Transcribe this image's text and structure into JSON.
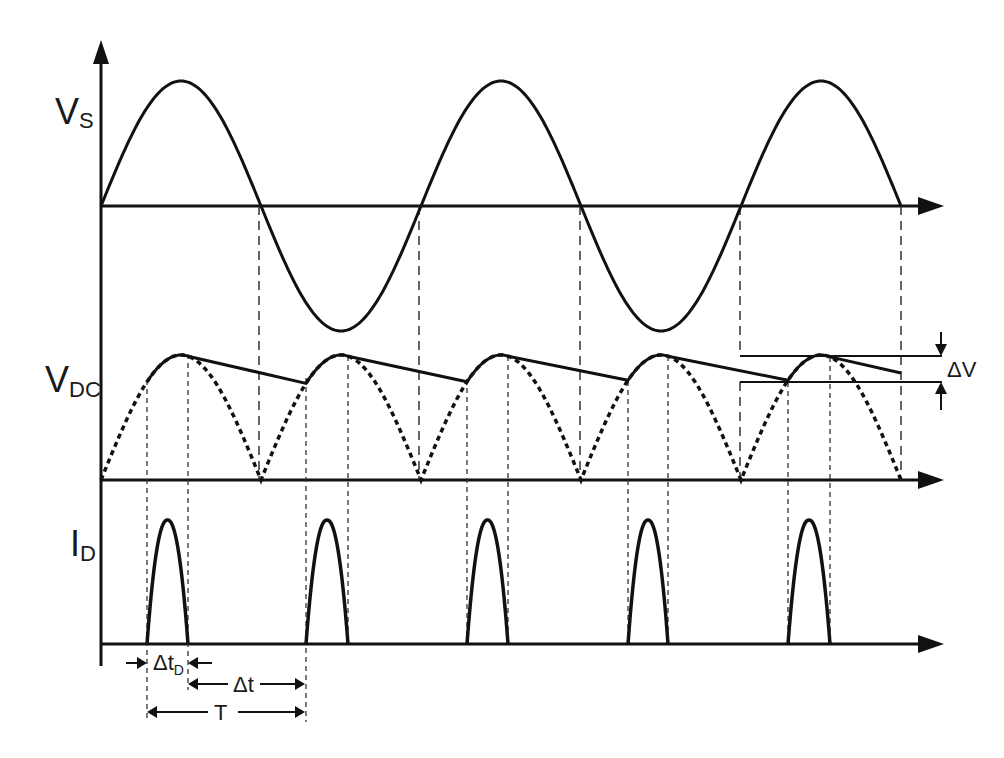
{
  "diagram": {
    "colors": {
      "stroke": "#111111",
      "background": "#ffffff"
    },
    "panels": [
      {
        "id": "vs",
        "label_main": "V",
        "label_sub": "S",
        "description": "Source sinusoidal voltage"
      },
      {
        "id": "vdc",
        "label_main": "V",
        "label_sub": "DC",
        "description": "Rectified (dotted) and filtered output voltage with ripple"
      },
      {
        "id": "id",
        "label_main": "I",
        "label_sub": "D",
        "description": "Diode current pulses"
      }
    ],
    "annotations": {
      "delta_v": "ΔV",
      "delta_t_d_main": "Δt",
      "delta_t_d_sub": "D",
      "delta_t": "Δt",
      "period": "T"
    }
  },
  "chart_data": {
    "type": "line",
    "title": "",
    "series": [
      {
        "name": "V_S",
        "shape": "sine",
        "cycles": 2.5,
        "zero_crossings_px": [
          101,
          259,
          419,
          580,
          740,
          901
        ]
      },
      {
        "name": "V_DC rectified (dotted)",
        "shape": "|sine|",
        "half_cycles": 5
      },
      {
        "name": "V_DC filtered",
        "shape": "ripple",
        "charging_intervals_px": [
          [
            147,
            188
          ],
          [
            306,
            348
          ],
          [
            467,
            508
          ],
          [
            628,
            668
          ],
          [
            788,
            830
          ]
        ]
      },
      {
        "name": "I_D",
        "shape": "pulses",
        "pulse_count": 5
      }
    ],
    "annotations": [
      "ΔV",
      "Δt_D",
      "Δt",
      "T"
    ]
  }
}
